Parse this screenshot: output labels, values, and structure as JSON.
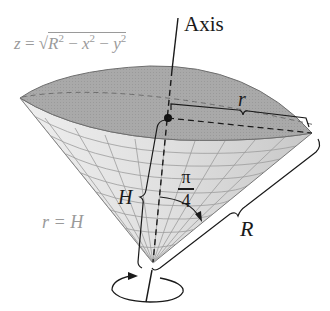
{
  "figure": {
    "type": "cone with spherical cap (ice-cream cone region)",
    "labels": {
      "sphere_equation_lhs": "z = ",
      "sphere_equation_radicand": {
        "R": "R",
        "x": "x",
        "y": "y",
        "exp": "2",
        "minus": " − "
      },
      "cone_equation": "r = H",
      "axis": "Axis",
      "small_radius": "r",
      "height": "H",
      "angle_numerator": "π",
      "angle_denominator": "4",
      "slant_radius": "R"
    },
    "colors": {
      "cap_fill": "#a8a8a8",
      "cone_fill": "#e2e2e2",
      "grid_line": "#9c9c9c",
      "ink": "#1a1a1a",
      "gray_text": "#9a9a9a"
    }
  }
}
